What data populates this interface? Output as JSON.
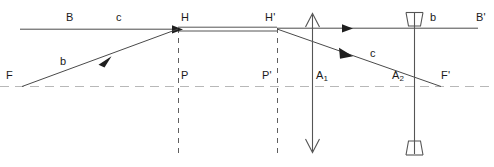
{
  "diagram": {
    "type": "optical-ray-diagram",
    "canvas": {
      "width": 494,
      "height": 167
    },
    "colors": {
      "ray": "#3a3a3a",
      "axis": "#b8b8b8",
      "dashed_guide": "#6e6e6e",
      "label": "#1a1a1a",
      "background": "#ffffff"
    },
    "optical_axis": {
      "y": 86,
      "x_start": 0,
      "x_end": 494,
      "style": "dashed",
      "color": "#b8b8b8"
    },
    "principal_planes": {
      "H": {
        "x": 178,
        "label": "H",
        "label_x": 180,
        "label_y": 14
      },
      "H_prime": {
        "x": 277,
        "label": "H'",
        "label_x": 268,
        "label_y": 14
      },
      "connector_y_top": 27,
      "connector_y_bottom": 31
    },
    "vertical_guides": [
      {
        "name": "P",
        "x": 178,
        "y_top": 28,
        "y_bottom": 155,
        "label": "P",
        "label_x": 180,
        "label_y": 66
      },
      {
        "name": "P'",
        "x": 277,
        "y_top": 28,
        "y_bottom": 155,
        "label": "P'",
        "label_x": 266,
        "label_y": 66
      }
    ],
    "objects": [
      {
        "name": "A1",
        "kind": "double-headed-open-arrow",
        "x": 312,
        "y_top": 14,
        "y_bottom": 152,
        "label": "A",
        "subscript": "1",
        "label_x": 316,
        "label_y": 66
      },
      {
        "name": "A2",
        "kind": "double-headed-concave-tail-arrow",
        "x": 414,
        "y_top": 12,
        "y_bottom": 155,
        "label": "A",
        "subscript": "2",
        "label_x": 394,
        "label_y": 66
      }
    ],
    "rays": [
      {
        "name": "incoming-axial-ray",
        "label": "c",
        "label_x": 118,
        "label_y": 14,
        "from": {
          "x": 20,
          "y": 29
        },
        "to": {
          "x": 178,
          "y": 29
        },
        "arrow_at": {
          "x": 182,
          "y": 29
        },
        "arrow_dir": "right"
      },
      {
        "name": "incoming-focal-ray",
        "label": "b",
        "label_x": 62,
        "label_y": 60,
        "from": {
          "x": 22,
          "y": 86
        },
        "to": {
          "x": 178,
          "y": 29
        },
        "arrow_at": {
          "x": 108,
          "y": 60
        },
        "arrow_dir": "up-right"
      },
      {
        "name": "outgoing-axial-ray",
        "label": "b",
        "label_x": 432,
        "label_y": 14,
        "from": {
          "x": 277,
          "y": 28
        },
        "to": {
          "x": 478,
          "y": 28
        },
        "arrow_at": {
          "x": 352,
          "y": 28
        },
        "arrow_dir": "right"
      },
      {
        "name": "outgoing-focal-ray",
        "label": "c",
        "label_x": 372,
        "label_y": 52,
        "from": {
          "x": 277,
          "y": 29
        },
        "to": {
          "x": 440,
          "y": 86
        },
        "arrow_at": {
          "x": 352,
          "y": 55
        },
        "arrow_dir": "down-right"
      }
    ],
    "point_labels": [
      {
        "name": "B",
        "text": "B",
        "x": 68,
        "y": 14
      },
      {
        "name": "F",
        "text": "F",
        "x": 8,
        "y": 66
      },
      {
        "name": "B-prime",
        "text": "B'",
        "x": 479,
        "y": 14
      },
      {
        "name": "F-prime",
        "text": "F'",
        "x": 443,
        "y": 66
      }
    ]
  }
}
